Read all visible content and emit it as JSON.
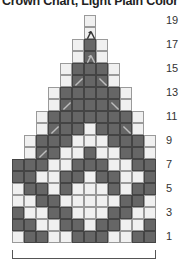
{
  "title": "Crown Chart, Light Plain Color",
  "colors": {
    "dark": "#666666",
    "light": "#f0f0f0",
    "grid": "#7a7a7a"
  },
  "cell_size_px": 12,
  "grid_origin": {
    "left_px": 12,
    "bottom_row_top_px": 231
  },
  "row_labels": [
    "19",
    "17",
    "15",
    "13",
    "11",
    "9",
    "7",
    "5",
    "3",
    "1"
  ],
  "legend": {
    "D": "dark (contrast color)",
    "W": "light (plain color)",
    "/": "decrease slant right",
    "\\": "decrease slant left",
    "λ": "central double decrease"
  },
  "rows": [
    {
      "row": 1,
      "start_col": 1,
      "cells": "WDDWWDDDWWDD"
    },
    {
      "row": 2,
      "start_col": 1,
      "cells": "DDWWDDWDDWWD"
    },
    {
      "row": 3,
      "start_col": 1,
      "cells": "DWWDDWWWDDWW"
    },
    {
      "row": 4,
      "start_col": 1,
      "cells": "WWDDWWWWWDDW"
    },
    {
      "row": 5,
      "start_col": 1,
      "cells": "WDDWDWWWDWDD"
    },
    {
      "row": 6,
      "start_col": 1,
      "cells": "DDWWDDWDDWWD"
    },
    {
      "row": 7,
      "start_col": 1,
      "cells": "DDDWWDDDWWDD"
    },
    {
      "row": 8,
      "start_col": 2,
      "cells": "WDDWWDWWDDW",
      "marks": {
        "3": "/"
      }
    },
    {
      "row": 9,
      "start_col": 2,
      "cells": "WDDDWWWDDDW"
    },
    {
      "row": 10,
      "start_col": 3,
      "cells": "WDDDWDDDW",
      "marks": {
        "4": "/",
        "10": "\\"
      }
    },
    {
      "row": 11,
      "start_col": 3,
      "cells": "WDDDDDDDW"
    },
    {
      "row": 12,
      "start_col": 4,
      "cells": "WDDDDDW",
      "marks": {
        "5": "/",
        "9": "\\"
      }
    },
    {
      "row": 13,
      "start_col": 4,
      "cells": "WDDDDDW"
    },
    {
      "row": 14,
      "start_col": 5,
      "cells": "WDDDW",
      "marks": {
        "6": "/",
        "8": "\\"
      }
    },
    {
      "row": 15,
      "start_col": 5,
      "cells": "WDDDW"
    },
    {
      "row": 16,
      "start_col": 6,
      "cells": "WDW",
      "marks": {
        "7": "λ"
      }
    },
    {
      "row": 17,
      "start_col": 6,
      "cells": "WDW"
    },
    {
      "row": 18,
      "start_col": 7,
      "cells": "W",
      "marks": {
        "7": "λ"
      }
    },
    {
      "row": 19,
      "start_col": 7,
      "cells": "W"
    }
  ]
}
